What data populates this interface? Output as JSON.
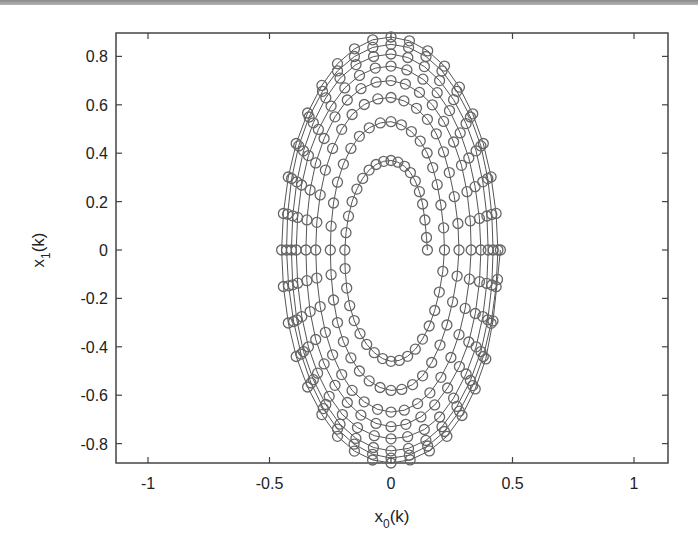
{
  "chart_data": {
    "type": "line",
    "title": "",
    "xlabel": "x_0(k)",
    "ylabel": "x_1(k)",
    "xlabel_main": "x",
    "xlabel_sub": "0",
    "xlabel_tail": "(k)",
    "ylabel_main": "x",
    "ylabel_sub": "1",
    "ylabel_tail": "(k)",
    "xlim": [
      -1.15,
      1.13
    ],
    "ylim": [
      -0.89,
      0.9
    ],
    "xticks": [
      -1,
      -0.5,
      0,
      0.5,
      1
    ],
    "xtick_labels": [
      "-1",
      "-0.5",
      "0",
      "0.5",
      "1"
    ],
    "yticks": [
      0.8,
      0.6,
      0.4,
      0.2,
      0,
      -0.2,
      -0.4,
      -0.6,
      -0.8
    ],
    "ytick_labels": [
      "0.8",
      "0.6",
      "0.4",
      "0.2",
      "0",
      "-0.2",
      "-0.4",
      "-0.6",
      "-0.8"
    ],
    "grid": false,
    "legend": null,
    "marker": "open circle",
    "line_color": "#555555",
    "marker_color": "#666666",
    "series": [
      {
        "name": "trajectory",
        "x": [
          0.15,
          0.13,
          0.08,
          0.0,
          -0.09,
          -0.16,
          -0.19,
          -0.17,
          -0.1,
          0.0,
          0.1,
          0.18,
          0.22,
          0.19,
          0.12,
          0.0,
          -0.13,
          -0.22,
          -0.25,
          -0.22,
          -0.13,
          0.0,
          0.13,
          0.23,
          0.28,
          0.24,
          0.15,
          0.0,
          -0.16,
          -0.27,
          -0.31,
          -0.27,
          -0.16,
          0.0,
          0.16,
          0.28,
          0.33,
          0.29,
          0.17,
          0.0,
          -0.18,
          -0.31,
          -0.35,
          -0.31,
          -0.18,
          0.0,
          0.18,
          0.32,
          0.37,
          0.32,
          0.19,
          0.0,
          -0.19,
          -0.34,
          -0.39,
          -0.34,
          -0.2,
          0.0,
          0.2,
          0.35,
          0.4,
          0.35,
          0.2,
          0.0,
          -0.21,
          -0.36,
          -0.41,
          -0.36,
          -0.21,
          0.0,
          0.21,
          0.37,
          0.42,
          0.37,
          0.21,
          0.0,
          -0.22,
          -0.38,
          -0.43,
          -0.37,
          -0.22,
          0.0,
          0.22,
          0.38,
          0.44,
          0.38,
          0.22,
          0.0,
          -0.22,
          -0.39,
          -0.45,
          -0.39,
          -0.22,
          0.0,
          0.23,
          0.39,
          0.45
        ],
        "y": [
          0.0,
          0.19,
          0.32,
          0.37,
          0.33,
          0.2,
          0.0,
          -0.23,
          -0.39,
          -0.46,
          -0.41,
          -0.25,
          0.0,
          0.27,
          0.45,
          0.53,
          0.47,
          0.28,
          0.0,
          -0.3,
          -0.5,
          -0.58,
          -0.52,
          -0.31,
          0.0,
          0.32,
          0.54,
          0.63,
          0.56,
          0.33,
          0.0,
          -0.34,
          -0.58,
          -0.67,
          -0.59,
          -0.35,
          0.0,
          0.35,
          0.6,
          0.7,
          0.62,
          0.36,
          0.0,
          -0.37,
          -0.63,
          -0.73,
          -0.64,
          -0.38,
          0.0,
          0.38,
          0.65,
          0.76,
          0.67,
          0.39,
          0.0,
          -0.4,
          -0.68,
          -0.78,
          -0.69,
          -0.4,
          0.0,
          0.41,
          0.7,
          0.81,
          0.71,
          0.41,
          0.0,
          -0.42,
          -0.72,
          -0.83,
          -0.73,
          -0.42,
          0.0,
          0.43,
          0.74,
          0.85,
          0.74,
          0.43,
          0.0,
          -0.43,
          -0.74,
          -0.86,
          -0.75,
          -0.44,
          0.0,
          0.44,
          0.76,
          0.88,
          0.77,
          0.44,
          0.0,
          -0.44,
          -0.77,
          -0.88,
          -0.77,
          -0.45,
          0.0
        ]
      }
    ]
  }
}
